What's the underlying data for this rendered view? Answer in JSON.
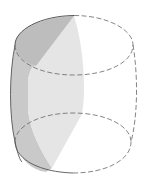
{
  "figure": {
    "description": "Barrel-shaped solid (bulging cylinder) with a shaded planar cross-section",
    "shape": "barrel",
    "colors": {
      "background": "#ffffff",
      "outline": "#555555",
      "dashed_outline": "#666666",
      "top_shade": "#bdbdbd",
      "side_shade": "#c9c9c9",
      "plane_shade": "#e5e5e5"
    },
    "top_ellipse": {
      "cx": 74,
      "cy": 45,
      "rx": 59,
      "ry": 30
    },
    "bottom_ellipse": {
      "cx": 73,
      "cy": 143,
      "rx": 58,
      "ry": 30
    },
    "side_bulge": {
      "left_x": 10,
      "right_x": 137,
      "mid_y": 95
    }
  }
}
